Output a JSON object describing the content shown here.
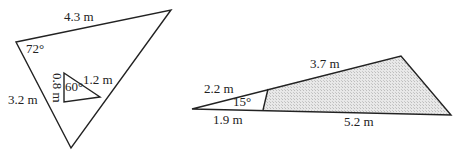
{
  "figure_left": {
    "outer_triangle": {
      "vertices": [
        [
          16,
          42
        ],
        [
          171,
          10
        ],
        [
          71,
          148
        ]
      ],
      "labels": {
        "top_side": "4.3 m",
        "left_side": "3.2 m",
        "angle_top_left": "72°"
      }
    },
    "inner_triangle": {
      "vertices": [
        [
          64,
          73
        ],
        [
          100,
          97
        ],
        [
          64,
          102
        ]
      ],
      "labels": {
        "hypotenuse": "1.2 m",
        "vertical_side": "0.8 m",
        "angle": "60°"
      }
    }
  },
  "figure_right": {
    "triangle": {
      "vertices": [
        [
          192,
          109
        ],
        [
          401,
          56
        ],
        [
          451,
          115
        ]
      ],
      "cut_line": [
        [
          268,
          89
        ],
        [
          263,
          110
        ]
      ],
      "labels": {
        "upper_small": "2.2 m",
        "upper_large": "3.7 m",
        "lower_small": "1.9 m",
        "lower_large": "5.2 m",
        "angle": "15°"
      }
    },
    "shaded_region_color": "#d8d8d8"
  },
  "colors": {
    "stroke": "#222222",
    "text": "#222222"
  }
}
